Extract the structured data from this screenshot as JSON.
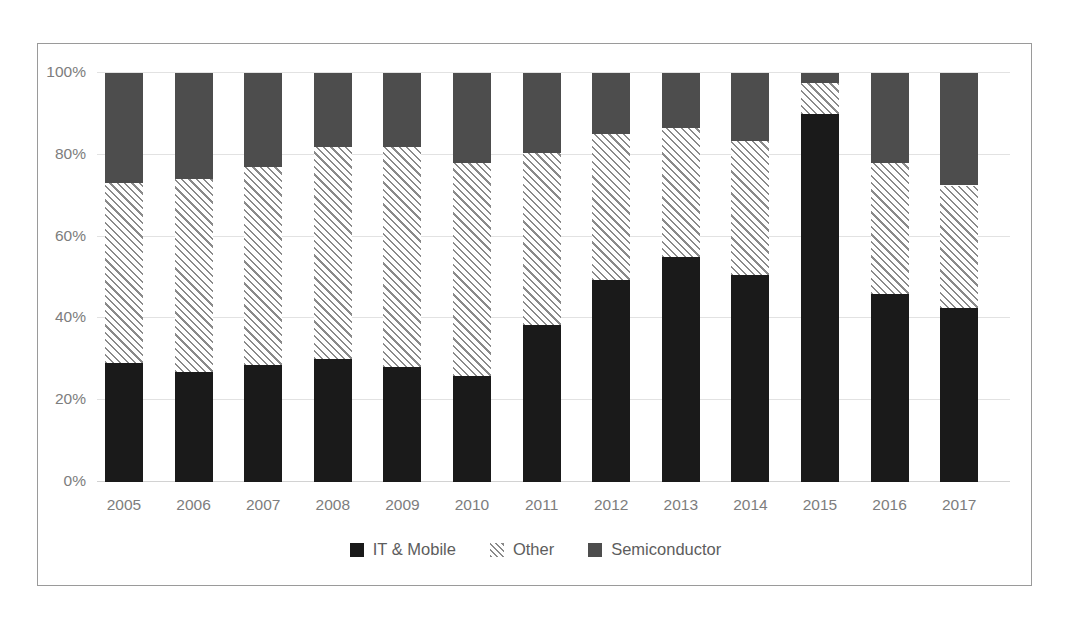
{
  "chart_data": {
    "type": "bar",
    "stacked": true,
    "normalized": "100%",
    "title": "",
    "xlabel": "",
    "ylabel": "",
    "ylim": [
      0,
      100
    ],
    "yticks": [
      "0%",
      "20%",
      "40%",
      "60%",
      "80%",
      "100%"
    ],
    "ytick_values": [
      0,
      20,
      40,
      60,
      80,
      100
    ],
    "grid": true,
    "legend_position": "bottom",
    "categories": [
      "2005",
      "2006",
      "2007",
      "2008",
      "2009",
      "2010",
      "2011",
      "2012",
      "2013",
      "2014",
      "2015",
      "2016",
      "2017"
    ],
    "series": [
      {
        "name": "IT & Mobile",
        "color": "#1a1a1a",
        "pattern": "solid",
        "values": [
          29,
          27,
          28.5,
          30,
          28,
          26,
          38.5,
          49.5,
          55,
          50.5,
          90,
          46,
          42.5
        ]
      },
      {
        "name": "Other",
        "color": "#8a8a8a",
        "pattern": "diagonal-hatch",
        "values": [
          44,
          47,
          48.5,
          52,
          54,
          52,
          42,
          35.5,
          31.5,
          33,
          7.5,
          32,
          30
        ]
      },
      {
        "name": "Semiconductor",
        "color": "#4d4d4d",
        "pattern": "solid",
        "values": [
          27,
          26,
          23,
          18,
          18,
          22,
          19.5,
          15,
          13.5,
          16.5,
          2.5,
          22,
          27.5
        ]
      }
    ]
  },
  "legend": {
    "items": [
      {
        "label": "IT & Mobile",
        "swatch": "black-square-swatch"
      },
      {
        "label": "Other",
        "swatch": "hatched-square-swatch"
      },
      {
        "label": "Semiconductor",
        "swatch": "gray-square-swatch"
      }
    ]
  },
  "colors": {
    "it_mobile": "#1a1a1a",
    "other": "#8a8a8a",
    "semiconductor": "#4d4d4d",
    "gridline": "#e2e2e2",
    "frame_border": "#9a9a9a",
    "tick_text": "#7d7d7d",
    "background": "#ffffff"
  }
}
